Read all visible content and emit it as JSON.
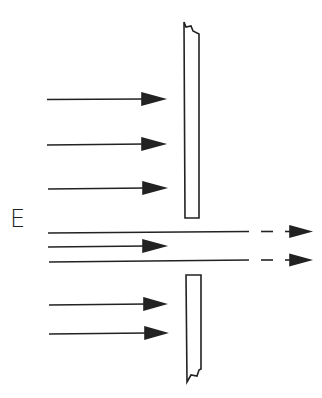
{
  "diagram": {
    "field_label": "E",
    "colors": {
      "stroke": "#222222",
      "background": "#ffffff"
    },
    "plates": [
      {
        "name": "upper-plate",
        "x": 183,
        "y": 22,
        "w": 16,
        "h": 196,
        "broken": "top"
      },
      {
        "name": "lower-plate",
        "x": 186,
        "y": 275,
        "w": 15,
        "h": 107,
        "broken": "bottom"
      }
    ],
    "arrows": [
      {
        "y": 99,
        "x1": 47,
        "x2": 163,
        "type": "blocked"
      },
      {
        "y": 144,
        "x1": 47,
        "x2": 163,
        "type": "blocked"
      },
      {
        "y": 188,
        "x1": 48,
        "x2": 164,
        "type": "blocked"
      },
      {
        "y": 232,
        "x1": 48,
        "x2": 310,
        "type": "transmitted"
      },
      {
        "y": 246,
        "x1": 48,
        "x2": 165,
        "type": "short"
      },
      {
        "y": 260,
        "x1": 49,
        "x2": 310,
        "type": "transmitted"
      },
      {
        "y": 304,
        "x1": 49,
        "x2": 165,
        "type": "blocked"
      },
      {
        "y": 333,
        "x1": 49,
        "x2": 166,
        "type": "blocked"
      }
    ]
  }
}
